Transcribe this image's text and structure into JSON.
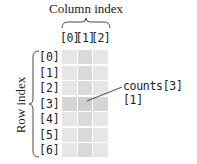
{
  "diagram": {
    "column_title": "Column index",
    "row_title": "Row index",
    "column_labels": [
      "[0]",
      "[1]",
      "[2]"
    ],
    "row_labels": [
      "[0]",
      "[1]",
      "[2]",
      "[3]",
      "[4]",
      "[5]",
      "[6]"
    ],
    "rows": 7,
    "columns": 3,
    "highlighted_cell": {
      "row": 3,
      "column": 1
    },
    "callout": "counts[3][1]",
    "colors": {
      "cell": "#e6e6e6",
      "cell_highlight_column": "#d9d9d9",
      "cell_highlight_row": "#d6d6d6",
      "cell_target": "#cfcfcf",
      "text": "#222222"
    }
  }
}
